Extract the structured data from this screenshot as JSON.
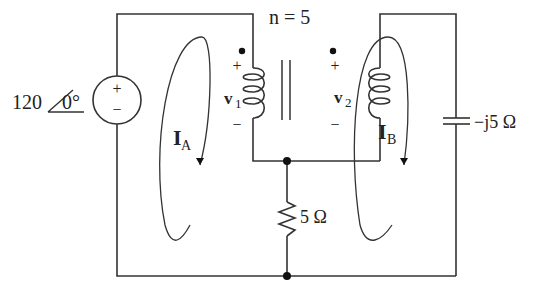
{
  "diagram": {
    "type": "circuit",
    "source": {
      "magnitude": "120",
      "angle": "0°",
      "plus": "+",
      "minus": "−"
    },
    "transformer": {
      "ratio_label": "n = 5",
      "primary_voltage": "v",
      "primary_sub": "1",
      "secondary_voltage": "v",
      "secondary_sub": "2",
      "plus": "+",
      "minus": "−"
    },
    "mesh_currents": [
      {
        "name": "I",
        "sub": "A"
      },
      {
        "name": "I",
        "sub": "B"
      }
    ],
    "resistor": {
      "label": "5 Ω"
    },
    "capacitor": {
      "label": "−j5 Ω"
    }
  },
  "colors": {
    "line": "#333333",
    "text": "#222222",
    "background": "#ffffff"
  }
}
